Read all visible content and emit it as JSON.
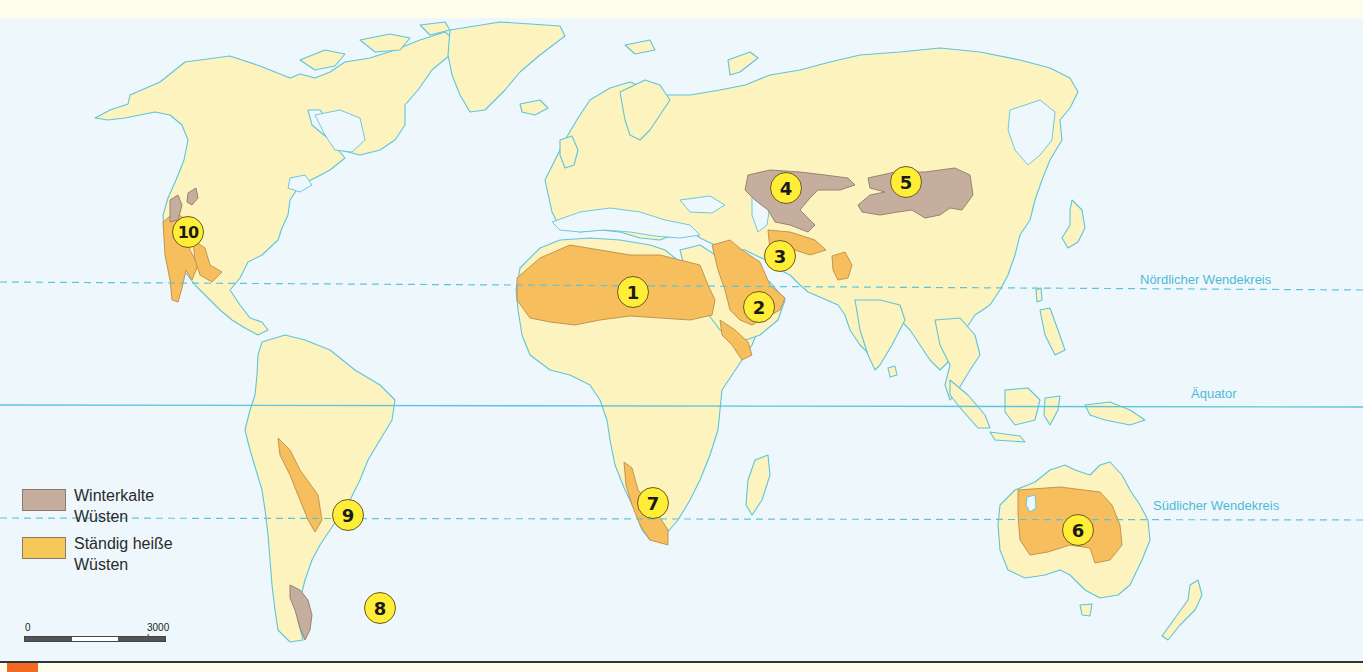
{
  "map": {
    "title": "Wüsten der Erde",
    "colors": {
      "ocean": "#EEF8FC",
      "land": "#FDF3BE",
      "coastline": "#5EC4DC",
      "hot_desert": "#F6BE5C",
      "cold_desert": "#C5AE9D",
      "badge": "#FFEE38",
      "line_label": "#4FB8D8",
      "accent_tab": "#F26A22"
    },
    "lines": {
      "tropic_north": "Nördlicher Wendekreis",
      "equator": "Äquator",
      "tropic_south": "Südlicher Wendekreis"
    },
    "deserts": [
      {
        "number": "1",
        "type": "hot"
      },
      {
        "number": "2",
        "type": "hot"
      },
      {
        "number": "3",
        "type": "hot"
      },
      {
        "number": "4",
        "type": "cold"
      },
      {
        "number": "5",
        "type": "cold"
      },
      {
        "number": "6",
        "type": "hot"
      },
      {
        "number": "7",
        "type": "hot"
      },
      {
        "number": "8",
        "type": "cold"
      },
      {
        "number": "9",
        "type": "hot"
      },
      {
        "number": "10",
        "type": "hot"
      }
    ]
  },
  "legend": {
    "items": [
      {
        "label_line1": "Winterkalte",
        "label_line2": "Wüsten",
        "color": "#C5AE9D"
      },
      {
        "label_line1": "Ständig heiße",
        "label_line2": "Wüsten",
        "color": "#F6BE5C"
      }
    ]
  },
  "scale": {
    "start_label": "0",
    "end_label": "3000 km"
  }
}
